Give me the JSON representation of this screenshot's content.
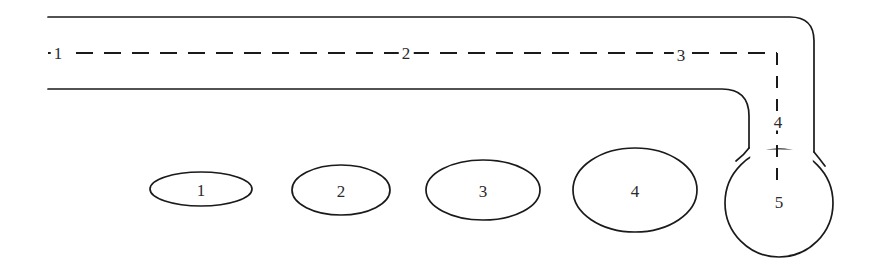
{
  "figure": {
    "title": "",
    "background_color": "#ffffff",
    "stroke_color": "#1a1a1a",
    "label_color": "#2b2b2b",
    "width": 886,
    "height": 266
  },
  "axis_labels": {
    "stage_1": "1",
    "stage_2": "2",
    "stage_3": "3",
    "stage_4": "4",
    "stage_5": "5"
  },
  "centerline_labels": [
    {
      "text": "1",
      "x": 58,
      "y": 53,
      "on_line": true
    },
    {
      "text": "2",
      "x": 406,
      "y": 53,
      "on_line": true
    },
    {
      "text": "3",
      "x": 681,
      "y": 55,
      "on_line": true
    },
    {
      "text": "4",
      "x": 778,
      "y": 122,
      "on_line": true
    },
    {
      "text": "5",
      "x": 779,
      "y": 202,
      "on_line": true
    }
  ],
  "cross_sections": [
    {
      "label": "1",
      "cx": 201,
      "cy": 189,
      "rx": 51,
      "ry": 17
    },
    {
      "label": "2",
      "cx": 341,
      "cy": 190,
      "rx": 49,
      "ry": 25
    },
    {
      "label": "3",
      "cx": 483,
      "cy": 190,
      "rx": 57,
      "ry": 30
    },
    {
      "label": "4",
      "cx": 635,
      "cy": 190,
      "rx": 62,
      "ry": 42
    },
    {
      "label": "5",
      "cx": 779,
      "cy": 203,
      "rx": 54,
      "ry": 54
    }
  ],
  "geometry": {
    "outer_wall_path": "M 48 17 L 790 17 Q 814 17 814 41 L 814 152",
    "inner_wall_path": "M 48 89 L 722 89 Q 749 89 749 116 L 749 148",
    "centerline_horizontal": "M 48 53 L 777 53",
    "centerline_vertical": "M 777 53 L 777 180",
    "bulb_circle": {
      "cx": 779,
      "cy": 203,
      "r": 54
    }
  }
}
